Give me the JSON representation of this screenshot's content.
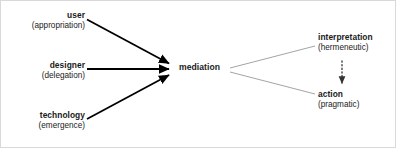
{
  "diagram": {
    "type": "mediation-flow-diagram",
    "canvas": {
      "width": 396,
      "height": 148,
      "background": "#ffffff",
      "border_color": "#d9d9d9"
    },
    "nodes": {
      "user": {
        "title": "user",
        "sub": "(appropriation)"
      },
      "designer": {
        "title": "designer",
        "sub": "(delegation)"
      },
      "technology": {
        "title": "technology",
        "sub": "(emergence)"
      },
      "mediation": {
        "title": "mediation",
        "sub": ""
      },
      "interpretation": {
        "title": "interpretation",
        "sub": "(hermeneutic)"
      },
      "action": {
        "title": "action",
        "sub": "(pragmatic)"
      }
    },
    "edges": [
      {
        "name": "user-to-mediation",
        "from": "user",
        "to": "mediation",
        "style": "solid-thick",
        "arrowhead": true,
        "color": "#000000"
      },
      {
        "name": "designer-to-mediation",
        "from": "designer",
        "to": "mediation",
        "style": "solid-thick",
        "arrowhead": true,
        "color": "#000000"
      },
      {
        "name": "technology-to-mediation",
        "from": "technology",
        "to": "mediation",
        "style": "solid-thick",
        "arrowhead": true,
        "color": "#000000"
      },
      {
        "name": "mediation-to-interpretation",
        "from": "mediation",
        "to": "interpretation",
        "style": "thin-light",
        "arrowhead": false,
        "color": "#999999"
      },
      {
        "name": "mediation-to-action",
        "from": "mediation",
        "to": "action",
        "style": "thin-light",
        "arrowhead": false,
        "color": "#999999"
      },
      {
        "name": "interpretation-to-action",
        "from": "interpretation",
        "to": "action",
        "style": "dotted",
        "arrowhead": true,
        "color": "#333333"
      }
    ]
  }
}
